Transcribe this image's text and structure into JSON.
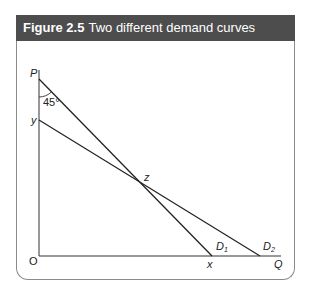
{
  "figure": {
    "number": "Figure 2.5",
    "title": "Two different demand curves"
  },
  "diagram": {
    "axes": {
      "y_label": "P",
      "x_label": "Q",
      "origin_label": "O"
    },
    "points": {
      "P": "P",
      "y": "y",
      "z": "z",
      "x": "x"
    },
    "angle_label": "45°",
    "curves": [
      {
        "name": "D1",
        "label_main": "D",
        "label_sub": "1",
        "from": "P",
        "to": "x"
      },
      {
        "name": "D2",
        "label_main": "D",
        "label_sub": "2",
        "from": "y",
        "to": "Q-axis"
      }
    ],
    "intersection": "z"
  }
}
